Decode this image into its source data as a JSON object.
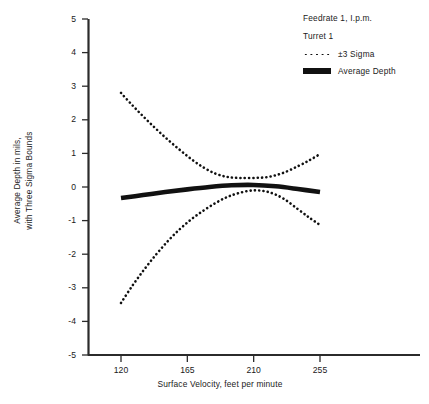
{
  "chart_data": {
    "type": "line",
    "title": "",
    "xlabel": "Surface Velocity, feet per minute",
    "ylabel": "Average Depth in mils, with Three Sigma Bounds",
    "ylabel_line1": "Average Depth in mils,",
    "ylabel_line2": "with Three Sigma Bounds",
    "xlim": [
      111,
      300
    ],
    "ylim": [
      -5,
      5
    ],
    "xticks": [
      120,
      165,
      210,
      255
    ],
    "yticks": [
      5,
      4,
      3,
      2,
      1,
      0,
      -1,
      -2,
      -3,
      -4,
      -5
    ],
    "ytick_labels": [
      "5",
      "4",
      "3",
      "2",
      "1",
      "0",
      "-1",
      "-2",
      "-3",
      "-4",
      "-5"
    ],
    "grid": false,
    "legend_position": "upper-right",
    "series": [
      {
        "name": "+3 Sigma",
        "style": "dotted",
        "legend_key": "±3 Sigma",
        "x": [
          120,
          128,
          136,
          144,
          152,
          160,
          168,
          176,
          184,
          192,
          200,
          210,
          220,
          230,
          240,
          248,
          255
        ],
        "values": [
          2.8,
          2.42,
          2.06,
          1.72,
          1.4,
          1.1,
          0.82,
          0.58,
          0.4,
          0.3,
          0.27,
          0.27,
          0.3,
          0.42,
          0.62,
          0.8,
          0.98
        ]
      },
      {
        "name": "-3 Sigma",
        "style": "dotted",
        "legend_key": "±3 Sigma",
        "x": [
          120,
          128,
          136,
          144,
          152,
          160,
          168,
          176,
          184,
          192,
          200,
          210,
          220,
          230,
          240,
          248,
          255
        ],
        "values": [
          -3.45,
          -2.92,
          -2.44,
          -2.0,
          -1.6,
          -1.25,
          -0.95,
          -0.7,
          -0.48,
          -0.3,
          -0.18,
          -0.1,
          -0.15,
          -0.34,
          -0.66,
          -0.92,
          -1.13
        ]
      },
      {
        "name": "Average Depth",
        "style": "solid",
        "legend_key": "Average Depth",
        "x": [
          120,
          135,
          150,
          165,
          180,
          195,
          210,
          225,
          240,
          255
        ],
        "values": [
          -0.33,
          -0.24,
          -0.15,
          -0.07,
          0.0,
          0.05,
          0.06,
          0.02,
          -0.06,
          -0.15
        ]
      }
    ],
    "annotations": [
      "Feedrate 1, I.p.m.",
      "Turret 1"
    ]
  },
  "legend": {
    "note_line1": "Feedrate 1, I.p.m.",
    "note_line2": "Turret 1",
    "entries": [
      {
        "label": "±3  Sigma",
        "swatch": "dotted"
      },
      {
        "label": "Average Depth",
        "swatch": "solid"
      }
    ]
  },
  "axes": {
    "x_title": "Surface Velocity, feet per minute",
    "y_title_line1": "Average Depth in mils,",
    "y_title_line2": "with Three Sigma Bounds",
    "x_tick_labels": [
      "120",
      "165",
      "210",
      "255"
    ],
    "y_tick_labels": [
      "5",
      "4",
      "3",
      "2",
      "1",
      "0",
      "-1",
      "-2",
      "-3",
      "-4",
      "-5"
    ]
  },
  "colors": {
    "ink": "#1a1a1a",
    "curve": "#111111",
    "background": "#ffffff"
  }
}
